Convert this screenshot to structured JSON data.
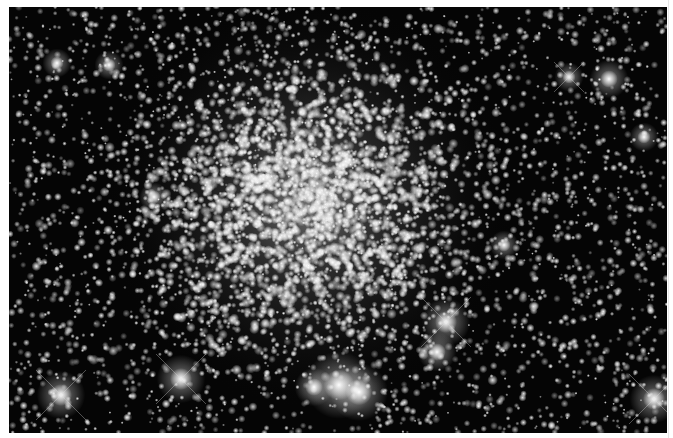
{
  "image": {
    "subject": "globular star cluster",
    "background_color": "#050505",
    "margin_color": "#ffffff",
    "frame": {
      "x": 9,
      "y": 7,
      "width": 658,
      "height": 426
    }
  },
  "cluster": {
    "center": [
      300,
      195
    ],
    "core_radius": 70,
    "halo_radius": 210,
    "core_glow_color": "#d8d8d8"
  },
  "field": {
    "seed": 12345,
    "faint_star_count": 3200,
    "cluster_star_count": 2600
  },
  "bright_stars": [
    {
      "x": 52,
      "y": 388,
      "r": 5,
      "spikes": true
    },
    {
      "x": 172,
      "y": 372,
      "r": 5,
      "spikes": true
    },
    {
      "x": 437,
      "y": 315,
      "r": 5,
      "spikes": true
    },
    {
      "x": 428,
      "y": 345,
      "r": 4,
      "spikes": false
    },
    {
      "x": 645,
      "y": 392,
      "r": 5,
      "spikes": true
    },
    {
      "x": 330,
      "y": 378,
      "r": 7,
      "spikes": false
    },
    {
      "x": 350,
      "y": 385,
      "r": 6,
      "spikes": false
    },
    {
      "x": 305,
      "y": 380,
      "r": 4,
      "spikes": false
    },
    {
      "x": 600,
      "y": 72,
      "r": 4,
      "spikes": false
    },
    {
      "x": 100,
      "y": 58,
      "r": 3,
      "spikes": false
    },
    {
      "x": 48,
      "y": 56,
      "r": 3,
      "spikes": false
    },
    {
      "x": 635,
      "y": 130,
      "r": 3,
      "spikes": false
    },
    {
      "x": 560,
      "y": 70,
      "r": 3,
      "spikes": true
    },
    {
      "x": 495,
      "y": 238,
      "r": 3,
      "spikes": false
    },
    {
      "x": 145,
      "y": 190,
      "r": 3,
      "spikes": false
    }
  ]
}
